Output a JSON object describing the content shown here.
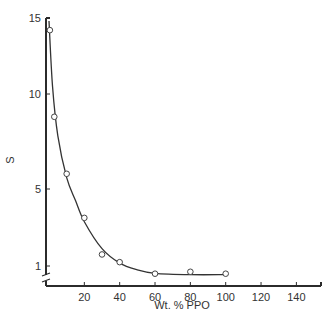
{
  "chart_data": {
    "type": "scatter",
    "title": "",
    "xlabel": "Wt. % PPO",
    "ylabel": "S",
    "xlim": [
      0,
      150
    ],
    "ylim": [
      0,
      15
    ],
    "x_ticks": [
      20,
      40,
      60,
      80,
      100,
      120,
      140
    ],
    "y_ticks": [
      1,
      5,
      10,
      15
    ],
    "y_axis_break": true,
    "grid": false,
    "legend": null,
    "series": [
      {
        "name": "S vs Wt. % PPO (data points)",
        "marker": "open-circle",
        "x": [
          0.5,
          3,
          10,
          20,
          30,
          40,
          60,
          80,
          100
        ],
        "y": [
          14.2,
          8.8,
          5.8,
          3.5,
          1.6,
          1.2,
          0.6,
          0.7,
          0.6
        ]
      },
      {
        "name": "fitted curve",
        "style": "solid-line",
        "x": [
          0,
          2,
          5,
          10,
          15,
          20,
          30,
          40,
          50,
          60,
          80,
          100
        ],
        "y": [
          14.8,
          10.5,
          7.8,
          5.6,
          4.4,
          3.3,
          1.9,
          1.15,
          0.8,
          0.62,
          0.55,
          0.55
        ]
      }
    ]
  },
  "labels": {
    "ylabel": "S",
    "xlabel": "Wt. % PPO",
    "y_tick_labels": [
      "15",
      "10",
      "5",
      "1"
    ],
    "x_tick_labels": [
      "20",
      "40",
      "60",
      "80",
      "100",
      "120",
      "140"
    ]
  }
}
